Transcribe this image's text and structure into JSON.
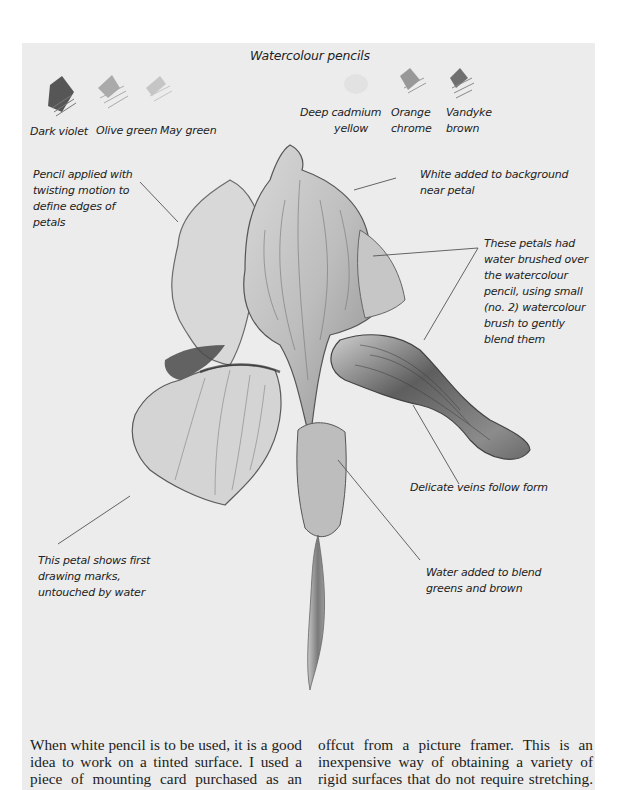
{
  "panel": {
    "title": "Watercolour pencils",
    "background": "#ececec",
    "swatches": [
      {
        "id": "dark-violet",
        "label_lines": [
          "Dark violet"
        ],
        "tone": "#3a3a3a"
      },
      {
        "id": "olive-green",
        "label_lines": [
          "Olive green"
        ],
        "tone": "#8a8a8a"
      },
      {
        "id": "may-green",
        "label_lines": [
          "May green"
        ],
        "tone": "#b0b0b0"
      },
      {
        "id": "deep-cadmium-yellow",
        "label_lines": [
          "Deep cadmium",
          "yellow"
        ],
        "tone": "#e0e0e0"
      },
      {
        "id": "orange-chrome",
        "label_lines": [
          "Orange",
          "chrome"
        ],
        "tone": "#808080"
      },
      {
        "id": "vandyke-brown",
        "label_lines": [
          "Vandyke",
          "brown"
        ],
        "tone": "#5a5a5a"
      }
    ],
    "annotations": [
      {
        "id": "twisting-motion",
        "lines": [
          "Pencil applied with",
          "twisting motion to",
          "define edges of",
          "petals"
        ]
      },
      {
        "id": "white-background",
        "lines": [
          "White added to background",
          "near petal"
        ]
      },
      {
        "id": "water-brushed",
        "lines": [
          "These petals had",
          "water brushed over",
          "the watercolour",
          "pencil, using small",
          "(no. 2) watercolour",
          "brush to gently",
          "blend them"
        ]
      },
      {
        "id": "delicate-veins",
        "lines": [
          "Delicate veins follow form"
        ]
      },
      {
        "id": "first-marks",
        "lines": [
          "This petal shows first",
          "drawing marks,",
          "untouched by water"
        ]
      },
      {
        "id": "water-blend",
        "lines": [
          "Water added to blend",
          "greens and brown"
        ]
      }
    ]
  },
  "body": {
    "left_column": [
      "When white pencil is to be used, it is a good",
      "idea to work on a tinted surface. I used a",
      "piece of mounting card purchased as an"
    ],
    "right_column": [
      "offcut from a picture framer. This is an",
      "inexpensive way of obtaining a variety of",
      "rigid surfaces that do not require stretching."
    ]
  }
}
